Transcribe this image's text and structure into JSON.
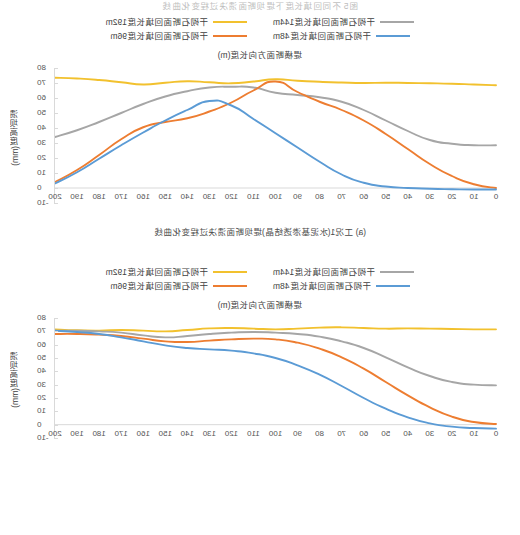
{
  "page": {
    "header_caption": "图5 不同回填长度下堤坝断面溃决过程变化曲线"
  },
  "legend": {
    "series": [
      {
        "label": "干砌石断面回填长度192m",
        "color": "#f2c12e",
        "key": "l192"
      },
      {
        "label": "干砌石断面回填长度144m",
        "color": "#a6a6a6",
        "key": "l144"
      },
      {
        "label": "干砌石断面回填长度96m",
        "color": "#ed7d31",
        "key": "l96"
      },
      {
        "label": "干砌石断面回填长度48m",
        "color": "#5b9bd5",
        "key": "l48"
      }
    ]
  },
  "axis": {
    "x_title": "堤横断面方向长度(m)",
    "y_title": "溃坝高度(mm)",
    "x_ticks": [
      "0",
      "10",
      "20",
      "30",
      "40",
      "50",
      "60",
      "70",
      "80",
      "90",
      "100",
      "110",
      "120",
      "130",
      "140",
      "150",
      "160",
      "170",
      "180",
      "190",
      "200"
    ],
    "y_ticks": [
      "-10",
      "0",
      "10",
      "20",
      "30",
      "40",
      "50",
      "60",
      "70",
      "80"
    ]
  },
  "figures": [
    {
      "id": "fig-a",
      "caption": "(a) 工况1(水泥基渗透结晶)堤坝断面溃决过程变化曲线",
      "chart_data": {
        "type": "line",
        "title": "(a) 工况1(水泥基渗透结晶)堤坝断面溃决过程变化曲线",
        "xlabel": "堤横断面方向长度(m)",
        "ylabel": "溃坝高度(mm)",
        "xlim": [
          0,
          200
        ],
        "ylim": [
          -10,
          80
        ],
        "grid": false,
        "legend_position": "top",
        "x": [
          0,
          10,
          20,
          30,
          40,
          50,
          60,
          70,
          80,
          90,
          100,
          110,
          120,
          130,
          140,
          150,
          160,
          170,
          180,
          190,
          200
        ],
        "series": [
          {
            "name": "干砌石断面回填长度192m",
            "color": "#f2c12e",
            "values": [
              68.5,
              69.0,
              69.5,
              69.8,
              70.0,
              70.2,
              70.0,
              70.3,
              70.8,
              71.5,
              72.5,
              71.0,
              69.8,
              70.5,
              71.2,
              70.2,
              69.0,
              70.5,
              72.0,
              73.0,
              73.5
            ]
          },
          {
            "name": "干砌石断面回填长度144m",
            "color": "#a6a6a6",
            "values": [
              28.5,
              28.5,
              29.5,
              32.0,
              38.0,
              45.0,
              52.0,
              57.5,
              60.5,
              62.0,
              63.5,
              67.0,
              67.5,
              67.0,
              64.5,
              61.0,
              56.0,
              50.0,
              44.0,
              38.5,
              34.0
            ]
          },
          {
            "name": "干砌石断面回填长度96m",
            "color": "#ed7d31",
            "values": [
              0.0,
              2.5,
              8.0,
              16.0,
              26.0,
              36.0,
              45.0,
              52.0,
              57.5,
              64.0,
              71.0,
              65.0,
              57.0,
              51.0,
              46.5,
              44.0,
              40.5,
              32.5,
              22.0,
              12.0,
              4.0
            ]
          },
          {
            "name": "干砌石断面回填长度48m",
            "color": "#5b9bd5",
            "values": [
              -1.0,
              -1.0,
              -0.8,
              -0.5,
              0.0,
              1.0,
              3.5,
              9.0,
              17.5,
              27.0,
              36.5,
              46.0,
              55.0,
              58.0,
              52.0,
              45.0,
              37.0,
              28.5,
              19.5,
              10.5,
              3.0
            ]
          }
        ]
      }
    },
    {
      "id": "fig-b",
      "caption": "(b) 工况2堤坝断面溃决过程变化曲线",
      "chart_data": {
        "type": "line",
        "title": "(b) 工况2堤坝断面溃决过程变化曲线",
        "xlabel": "堤横断面方向长度(m)",
        "ylabel": "溃坝高度(mm)",
        "xlim": [
          0,
          200
        ],
        "ylim": [
          -10,
          80
        ],
        "grid": false,
        "legend_position": "top",
        "x": [
          0,
          10,
          20,
          30,
          40,
          50,
          60,
          70,
          80,
          90,
          100,
          110,
          120,
          130,
          140,
          150,
          160,
          170,
          180,
          190,
          200
        ],
        "series": [
          {
            "name": "干砌石断面回填长度192m",
            "color": "#f2c12e",
            "values": [
              71.5,
              71.5,
              71.8,
              72.0,
              72.2,
              72.0,
              72.5,
              73.0,
              72.8,
              72.0,
              71.5,
              72.0,
              72.5,
              72.2,
              71.0,
              70.0,
              70.5,
              71.0,
              70.5,
              70.8,
              71.5
            ]
          },
          {
            "name": "干砌石断面回填长度144m",
            "color": "#a6a6a6",
            "values": [
              29.5,
              30.0,
              32.0,
              36.5,
              43.0,
              50.5,
              57.5,
              62.5,
              66.0,
              68.0,
              69.0,
              69.5,
              69.0,
              68.0,
              66.5,
              65.5,
              67.0,
              69.0,
              70.0,
              70.5,
              70.5
            ]
          },
          {
            "name": "干砌石断面回填长度96m",
            "color": "#ed7d31",
            "values": [
              0.5,
              2.0,
              6.0,
              13.0,
              22.0,
              32.0,
              42.0,
              50.5,
              57.0,
              61.5,
              64.0,
              64.5,
              64.0,
              63.0,
              62.0,
              62.5,
              64.5,
              66.5,
              67.5,
              68.0,
              68.0
            ]
          },
          {
            "name": "干砌石断面回填长度48m",
            "color": "#5b9bd5",
            "values": [
              -3.0,
              -2.5,
              -1.5,
              1.0,
              5.5,
              12.0,
              20.0,
              29.0,
              37.5,
              44.5,
              50.0,
              53.5,
              55.5,
              56.5,
              57.5,
              59.5,
              62.5,
              65.5,
              68.0,
              69.5,
              70.5
            ]
          }
        ]
      }
    }
  ]
}
